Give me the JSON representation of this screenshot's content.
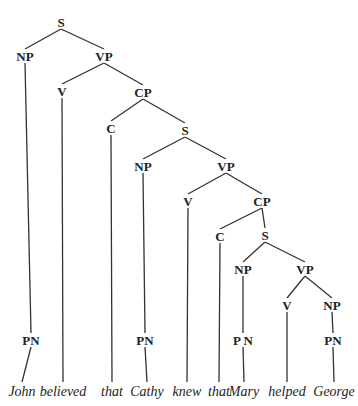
{
  "diagram": {
    "type": "syntax-tree",
    "nodes": [
      {
        "id": "S1",
        "label": "S",
        "x": 61,
        "y": 22
      },
      {
        "id": "NP1",
        "label": "NP",
        "x": 25,
        "y": 56
      },
      {
        "id": "VP1",
        "label": "VP",
        "x": 104,
        "y": 56
      },
      {
        "id": "V1",
        "label": "V",
        "x": 62,
        "y": 91
      },
      {
        "id": "CP1",
        "label": "CP",
        "x": 143,
        "y": 92
      },
      {
        "id": "C1",
        "label": "C",
        "x": 111,
        "y": 128
      },
      {
        "id": "S2",
        "label": "S",
        "x": 185,
        "y": 130
      },
      {
        "id": "NP2",
        "label": "NP",
        "x": 143,
        "y": 166
      },
      {
        "id": "VP2",
        "label": "VP",
        "x": 226,
        "y": 166
      },
      {
        "id": "V2",
        "label": "V",
        "x": 188,
        "y": 201
      },
      {
        "id": "CP2",
        "label": "CP",
        "x": 262,
        "y": 201
      },
      {
        "id": "C2",
        "label": "C",
        "x": 220,
        "y": 236
      },
      {
        "id": "S3",
        "label": "S",
        "x": 265,
        "y": 235
      },
      {
        "id": "NP3",
        "label": "NP",
        "x": 243,
        "y": 269
      },
      {
        "id": "VP3",
        "label": "VP",
        "x": 305,
        "y": 269
      },
      {
        "id": "V3",
        "label": "V",
        "x": 287,
        "y": 305
      },
      {
        "id": "NP4",
        "label": "NP",
        "x": 332,
        "y": 305
      },
      {
        "id": "PN1",
        "label": "PN",
        "x": 31,
        "y": 340
      },
      {
        "id": "PN2",
        "label": "PN",
        "x": 145,
        "y": 340
      },
      {
        "id": "PN3",
        "label": "P N",
        "x": 243,
        "y": 340
      },
      {
        "id": "PN4",
        "label": "PN",
        "x": 333,
        "y": 340
      }
    ],
    "edges": [
      [
        "S1",
        "NP1"
      ],
      [
        "S1",
        "VP1"
      ],
      [
        "VP1",
        "V1"
      ],
      [
        "VP1",
        "CP1"
      ],
      [
        "CP1",
        "C1"
      ],
      [
        "CP1",
        "S2"
      ],
      [
        "S2",
        "NP2"
      ],
      [
        "S2",
        "VP2"
      ],
      [
        "VP2",
        "V2"
      ],
      [
        "VP2",
        "CP2"
      ],
      [
        "CP2",
        "C2"
      ],
      [
        "CP2",
        "S3"
      ],
      [
        "S3",
        "NP3"
      ],
      [
        "S3",
        "VP3"
      ],
      [
        "VP3",
        "V3"
      ],
      [
        "VP3",
        "NP4"
      ],
      [
        "NP1",
        "PN1"
      ],
      [
        "NP2",
        "PN2"
      ],
      [
        "NP3",
        "PN3"
      ],
      [
        "NP4",
        "PN4"
      ]
    ],
    "words": [
      {
        "text": "John",
        "x": 22,
        "y": 392,
        "parent": "PN1"
      },
      {
        "text": "believed",
        "x": 63,
        "y": 392,
        "parent": "V1"
      },
      {
        "text": "that",
        "x": 112,
        "y": 392,
        "parent": "C1"
      },
      {
        "text": "Cathy",
        "x": 147,
        "y": 392,
        "parent": "PN2"
      },
      {
        "text": "knew",
        "x": 187,
        "y": 392,
        "parent": "V2"
      },
      {
        "text": "that",
        "x": 219,
        "y": 392,
        "parent": "C2"
      },
      {
        "text": "Mary",
        "x": 244,
        "y": 392,
        "parent": "PN3"
      },
      {
        "text": "helped",
        "x": 287,
        "y": 392,
        "parent": "V3"
      },
      {
        "text": "George",
        "x": 334,
        "y": 392,
        "parent": "PN4"
      }
    ]
  }
}
